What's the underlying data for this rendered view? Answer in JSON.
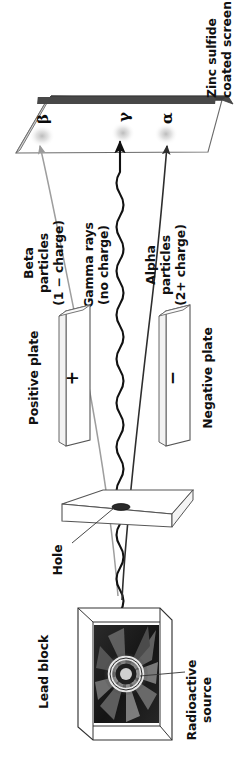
{
  "diagram": {
    "orientation_note": "rotated-90-clockwise",
    "labels": {
      "screen": "Zinc sulfide\ncoated screen",
      "screen_line1": "Zinc sulfide",
      "screen_line2": "coated screen",
      "beta_label_line1": "Beta",
      "beta_label_line2": "particles",
      "beta_label_line3": "(1 − charge)",
      "gamma_label_line1": "Gamma rays",
      "gamma_label_line2": "(no charge)",
      "alpha_label_line1": "Alpha",
      "alpha_label_line2": "particles",
      "alpha_label_line3": "(2+ charge)",
      "positive_plate": "Positive plate",
      "negative_plate": "Negative plate",
      "positive_sign": "+",
      "negative_sign": "−",
      "hole": "Hole",
      "lead_block": "Lead block",
      "radioactive_source_line1": "Radioactive",
      "radioactive_source_line2": "source"
    },
    "symbols": {
      "beta": "β",
      "gamma": "γ",
      "alpha": "α"
    },
    "colors": {
      "ink": "#111111",
      "screen_top": "#4a4a4a",
      "screen_face": "#ffffff",
      "beta_path": "#9a9a9a",
      "gamma_path": "#111111",
      "alpha_path": "#3a3a3a",
      "plate_outline": "#555555",
      "lead_block_outline": "#333333",
      "cavity_dark": "#1d1d1d",
      "source_glow": "#e8e8e8",
      "burst_gray": "#888888"
    }
  }
}
